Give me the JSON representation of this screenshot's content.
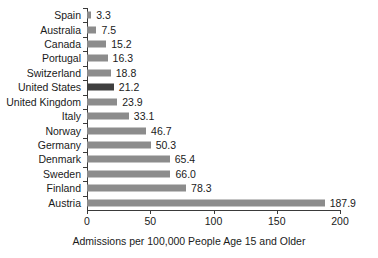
{
  "chart_data": {
    "type": "bar",
    "orientation": "horizontal",
    "title": "",
    "xlabel": "Admissions per 100,000 People Age 15 and Older",
    "ylabel": "",
    "xlim": [
      0,
      200
    ],
    "xticks": [
      0,
      50,
      100,
      150,
      200
    ],
    "xtick_labels": [
      "0",
      "50",
      "100",
      "150",
      "200"
    ],
    "grid": false,
    "legend": null,
    "categories": [
      "Spain",
      "Australia",
      "Canada",
      "Portugal",
      "Switzerland",
      "United States",
      "United Kingdom",
      "Italy",
      "Norway",
      "Germany",
      "Denmark",
      "Sweden",
      "Finland",
      "Austria"
    ],
    "values": [
      3.3,
      7.5,
      15.2,
      16.3,
      18.8,
      21.2,
      23.9,
      33.1,
      46.7,
      50.3,
      65.4,
      66.0,
      78.3,
      187.9
    ],
    "value_labels": [
      "3.3",
      "7.5",
      "15.2",
      "16.3",
      "18.8",
      "21.2",
      "23.9",
      "33.1",
      "46.7",
      "50.3",
      "65.4",
      "66.0",
      "78.3",
      "187.9"
    ],
    "highlighted_category": "United States",
    "colors": {
      "bar": "#8c8c8c",
      "bar_highlight": "#3f3f3f",
      "axis": "#3a3a3a",
      "text": "#1a1a1a",
      "background": "#ffffff"
    }
  }
}
